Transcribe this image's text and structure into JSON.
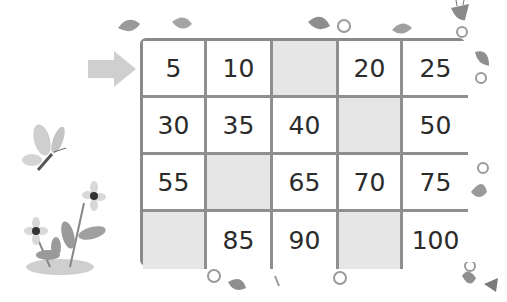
{
  "header": {
    "instruction_cut_off": ""
  },
  "puzzle": {
    "start_marker": "arrow-right",
    "step": 5,
    "rows": [
      [
        {
          "value": "5"
        },
        {
          "value": "10"
        },
        {
          "value": "",
          "blank": true
        },
        {
          "value": "20"
        },
        {
          "value": "25"
        }
      ],
      [
        {
          "value": "30"
        },
        {
          "value": "35"
        },
        {
          "value": "40"
        },
        {
          "value": "",
          "blank": true
        },
        {
          "value": "50"
        }
      ],
      [
        {
          "value": "55"
        },
        {
          "value": "",
          "blank": true
        },
        {
          "value": "65"
        },
        {
          "value": "70"
        },
        {
          "value": "75"
        }
      ],
      [
        {
          "value": "",
          "blank": true
        },
        {
          "value": "85"
        },
        {
          "value": "90"
        },
        {
          "value": "",
          "blank": true
        },
        {
          "value": "100"
        }
      ]
    ],
    "colors": {
      "grid_line": "#8f8f8f",
      "blank_fill": "#e6e6e6",
      "arrow": "#cfcfcf",
      "text": "#2b2b2b"
    }
  },
  "decorations": [
    "butterfly",
    "flowers",
    "vine-leaves",
    "bell-flower"
  ]
}
